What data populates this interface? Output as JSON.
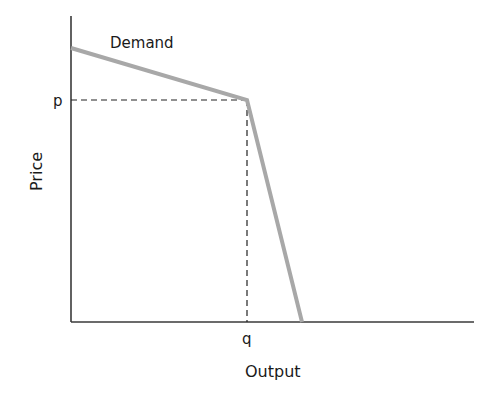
{
  "diagram": {
    "type": "kinked-demand-curve",
    "curve_label": "Demand",
    "x_axis": {
      "title": "Output",
      "tick_label": "q"
    },
    "y_axis": {
      "title": "Price",
      "tick_label": "p"
    },
    "colors": {
      "axis": "#3a3a3a",
      "demand_curve": "#a8a8a8",
      "guide_lines": "#222222",
      "text": "#1a1a1a"
    },
    "geometry": {
      "origin": [
        71,
        322
      ],
      "y_axis_top": [
        71,
        16
      ],
      "x_axis_end": [
        474,
        322
      ],
      "demand_start": [
        71,
        48
      ],
      "kink": [
        247,
        100
      ],
      "demand_end": [
        302,
        322
      ]
    }
  }
}
